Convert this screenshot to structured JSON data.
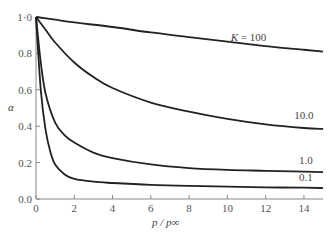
{
  "chart_data": {
    "type": "line",
    "title": "",
    "xlabel": "p / p∞",
    "ylabel": "α",
    "xlim": [
      0,
      15
    ],
    "ylim": [
      0,
      1.0
    ],
    "x_ticks": [
      0,
      2,
      4,
      6,
      8,
      10,
      12,
      14
    ],
    "y_ticks": [
      "0.0",
      "0.2",
      "0.4",
      "0.6",
      "0.8",
      "1·0"
    ],
    "grid": false,
    "legend": "inline labels at right end of curves",
    "series": [
      {
        "name": "K = 100",
        "label": "K = 100",
        "x": [
          0,
          1,
          2,
          4,
          6,
          8,
          10,
          12,
          14,
          15
        ],
        "y": [
          1.0,
          0.985,
          0.97,
          0.945,
          0.915,
          0.89,
          0.865,
          0.84,
          0.82,
          0.81
        ]
      },
      {
        "name": "10.0",
        "label": "10.0",
        "x": [
          0,
          0.5,
          1,
          2,
          3,
          4,
          6,
          8,
          10,
          12,
          14,
          15
        ],
        "y": [
          1.0,
          0.93,
          0.86,
          0.75,
          0.67,
          0.61,
          0.53,
          0.48,
          0.44,
          0.41,
          0.39,
          0.385
        ]
      },
      {
        "name": "1.0",
        "label": "1.0",
        "x": [
          0,
          0.25,
          0.5,
          1,
          1.5,
          2,
          3,
          4,
          6,
          8,
          10,
          12,
          14,
          15
        ],
        "y": [
          1.0,
          0.75,
          0.58,
          0.42,
          0.35,
          0.31,
          0.255,
          0.225,
          0.19,
          0.17,
          0.16,
          0.155,
          0.15,
          0.148
        ]
      },
      {
        "name": "0.1",
        "label": "0.1",
        "x": [
          0,
          0.25,
          0.5,
          0.75,
          1,
          1.5,
          2,
          3,
          4,
          6,
          8,
          10,
          12,
          14,
          15
        ],
        "y": [
          1.0,
          0.6,
          0.38,
          0.26,
          0.19,
          0.135,
          0.11,
          0.095,
          0.088,
          0.078,
          0.072,
          0.068,
          0.064,
          0.062,
          0.06
        ]
      }
    ]
  }
}
